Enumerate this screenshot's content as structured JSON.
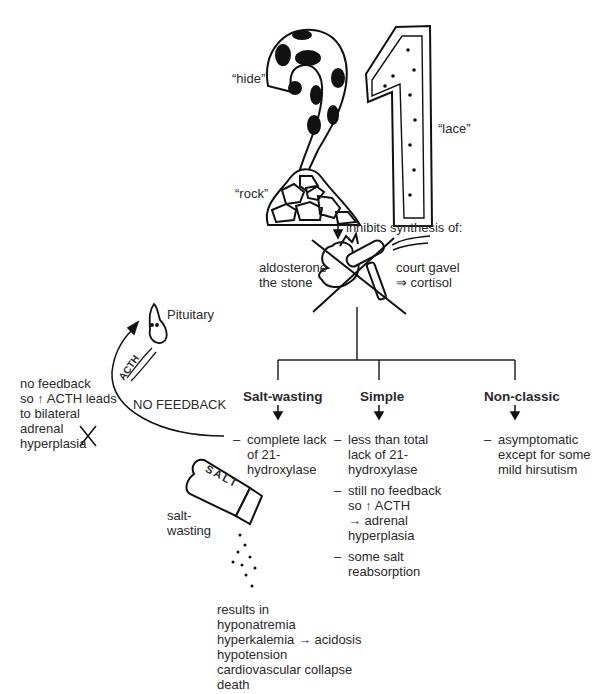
{
  "title_fragment": "",
  "mnemonic": {
    "number": "21",
    "labels": {
      "hide": "“hide”",
      "lace": "“lace”",
      "rock": "“rock”"
    }
  },
  "inhibits_label": "inhibits synthesis of:",
  "stone_label": "aldosterone\nthe stone",
  "gavel_label": "court gavel\n⇒ cortisol",
  "pituitary_label": "Pituitary",
  "acth_arrow_label": "ACTH",
  "feedback_note": "no feedback\nso ↑ ACTH leads\nto bilateral\nadrenal\nhyperplasia",
  "no_feedback_label": "NO FEEDBACK",
  "salt_shaker_label": "SALT",
  "salt_wasting_caption": "salt-\nwasting",
  "branches": [
    {
      "title": "Salt-wasting",
      "items": [
        "complete lack\nof 21-\nhydroxylase"
      ]
    },
    {
      "title": "Simple",
      "items": [
        "less than total\nlack of 21-\nhydroxylase",
        "still no feedback\nso ↑ ACTH\n→ adrenal\nhyperplasia",
        "some salt\nreabsorption"
      ]
    },
    {
      "title": "Non-classic",
      "items": [
        "asymptomatic\nexcept for some\nmild hirsutism"
      ]
    }
  ],
  "dash": "–",
  "results": "results in\nhyponatremia\nhyperkalemia → acidosis\nhypotension\ncardiovascular collapse\ndeath"
}
